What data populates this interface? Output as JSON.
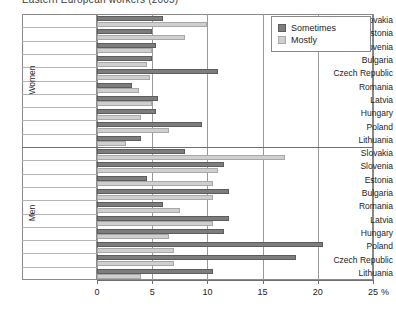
{
  "chart_data": {
    "type": "bar",
    "orientation": "horizontal",
    "title": "Eastern European workers (2005)",
    "xlabel": "",
    "ylabel": "",
    "unit": "%",
    "xlim": [
      0,
      25
    ],
    "xticks": [
      0,
      5,
      10,
      15,
      20,
      25
    ],
    "xticklabels": [
      "0",
      "5",
      "10",
      "15",
      "20",
      "25"
    ],
    "grid": "vertical",
    "legend_position": "top-right",
    "legend": [
      "Sometimes",
      "Mostly"
    ],
    "panels": [
      {
        "name": "Women",
        "categories": [
          "Slovakia",
          "Estonia",
          "Slovenia",
          "Bulgaria",
          "Czech Republic",
          "Romania",
          "Latvia",
          "Hungary",
          "Poland",
          "Lithuania"
        ],
        "series": [
          {
            "name": "Sometimes",
            "values": [
              6.0,
              5.0,
              5.3,
              5.0,
              11.0,
              3.2,
              5.5,
              5.3,
              9.5,
              4.0
            ]
          },
          {
            "name": "Mostly",
            "values": [
              10.0,
              8.0,
              5.0,
              4.5,
              4.8,
              3.8,
              5.0,
              4.0,
              6.5,
              2.6
            ]
          }
        ]
      },
      {
        "name": "Men",
        "categories": [
          "Slovakia",
          "Slovenia",
          "Estonia",
          "Bulgaria",
          "Romania",
          "Latvia",
          "Hungary",
          "Poland",
          "Czech Republic",
          "Lithuania"
        ],
        "series": [
          {
            "name": "Sometimes",
            "values": [
              8.0,
              11.5,
              4.5,
              12.0,
              6.0,
              12.0,
              11.5,
              20.5,
              18.0,
              10.5
            ]
          },
          {
            "name": "Mostly",
            "values": [
              17.0,
              11.0,
              10.5,
              10.5,
              7.5,
              10.5,
              6.5,
              7.0,
              7.0,
              4.0
            ]
          }
        ]
      }
    ]
  },
  "axis": {
    "unit_label": "%",
    "group_labels": [
      "Women",
      "Men"
    ]
  }
}
